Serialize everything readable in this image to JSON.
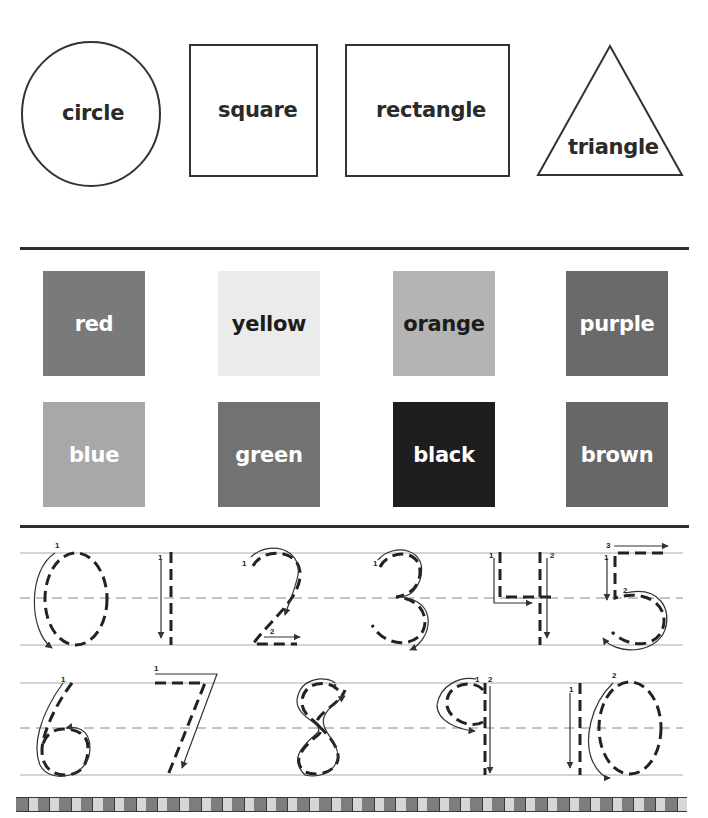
{
  "shapes": {
    "items": [
      {
        "name": "circle",
        "label": "circle"
      },
      {
        "name": "square",
        "label": "square"
      },
      {
        "name": "rectangle",
        "label": "rectangle"
      },
      {
        "name": "triangle",
        "label": "triangle"
      }
    ]
  },
  "colors": {
    "items": [
      {
        "label": "red",
        "fill": "#7a7a7a",
        "text": "#ffffff"
      },
      {
        "label": "yellow",
        "fill": "#ebebeb",
        "text": "#1c1c1c"
      },
      {
        "label": "orange",
        "fill": "#b4b4b4",
        "text": "#1c1c1c"
      },
      {
        "label": "purple",
        "fill": "#6a6a6a",
        "text": "#ffffff"
      },
      {
        "label": "blue",
        "fill": "#a8a8a8",
        "text": "#ffffff"
      },
      {
        "label": "green",
        "fill": "#727272",
        "text": "#ffffff"
      },
      {
        "label": "black",
        "fill": "#1e1e1e",
        "text": "#ffffff"
      },
      {
        "label": "brown",
        "fill": "#676767",
        "text": "#ffffff"
      }
    ]
  },
  "numbers": {
    "row1": [
      "0",
      "1",
      "2",
      "3",
      "4",
      "5"
    ],
    "row2": [
      "6",
      "7",
      "8",
      "9",
      "10"
    ],
    "stroke_labels": {
      "zero": [
        "1"
      ],
      "one": [
        "1"
      ],
      "two": [
        "1",
        "2"
      ],
      "three": [
        "1"
      ],
      "four": [
        "1",
        "2"
      ],
      "five": [
        "1",
        "2",
        "3"
      ],
      "six": [
        "1"
      ],
      "seven": [
        "1"
      ],
      "eight": [
        "1"
      ],
      "nine": [
        "1",
        "2"
      ],
      "ten": [
        "1",
        "2"
      ]
    }
  },
  "border": {
    "tile_count": 31,
    "dark": "#7d7d7d",
    "light": "#d6d6d6",
    "edge": "#3a3a3a"
  }
}
